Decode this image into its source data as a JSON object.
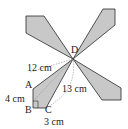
{
  "diagram": {
    "points": {
      "A": "A",
      "B": "B",
      "C": "C",
      "D": "D"
    },
    "measures": {
      "AD": "12 cm",
      "AB": "4 cm",
      "BC": "3 cm",
      "CD": "13 cm"
    },
    "fill_color": "#c8c8c8",
    "stroke_color": "#2a2a2a"
  }
}
